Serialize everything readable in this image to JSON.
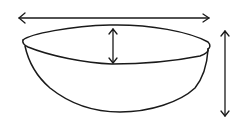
{
  "diagram": {
    "subject": "bowl",
    "stroke_color": "#1a1a1a",
    "background": "#ffffff",
    "measurements": [
      {
        "id": "width",
        "label": "diameter",
        "orientation": "horizontal"
      },
      {
        "id": "depth",
        "label": "inner depth",
        "orientation": "vertical"
      },
      {
        "id": "height",
        "label": "height",
        "orientation": "vertical"
      }
    ]
  }
}
